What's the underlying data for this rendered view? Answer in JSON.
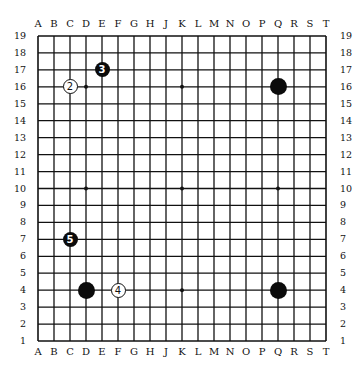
{
  "board": {
    "size": 19,
    "columns": [
      "A",
      "B",
      "C",
      "D",
      "E",
      "F",
      "G",
      "H",
      "J",
      "K",
      "L",
      "M",
      "N",
      "O",
      "P",
      "Q",
      "R",
      "S",
      "T"
    ],
    "rows": [
      "19",
      "18",
      "17",
      "16",
      "15",
      "14",
      "13",
      "12",
      "11",
      "10",
      "9",
      "8",
      "7",
      "6",
      "5",
      "4",
      "3",
      "2",
      "1"
    ],
    "grid_color": "#111111",
    "background": "#ffffff",
    "hoshi": [
      "D16",
      "K16",
      "Q16",
      "D10",
      "K10",
      "Q10",
      "D4",
      "K4",
      "Q4"
    ]
  },
  "stones": [
    {
      "point": "Q16",
      "color": "black",
      "number": ""
    },
    {
      "point": "D4",
      "color": "black",
      "number": ""
    },
    {
      "point": "Q4",
      "color": "black",
      "number": ""
    },
    {
      "point": "C16",
      "color": "white",
      "number": "2"
    },
    {
      "point": "E17",
      "color": "black",
      "number": "3"
    },
    {
      "point": "F4",
      "color": "white",
      "number": "4"
    },
    {
      "point": "C7",
      "color": "black",
      "number": "5"
    }
  ]
}
